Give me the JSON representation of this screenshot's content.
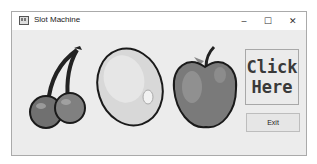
{
  "window": {
    "title": "Slot Machine",
    "app_icon": "slot-machine-icon",
    "controls": {
      "minimize": "–",
      "maximize": "☐",
      "close": "✕"
    }
  },
  "reels": [
    {
      "fruit": "cherries",
      "icon": "cherries-icon"
    },
    {
      "fruit": "lemon",
      "icon": "lemon-icon"
    },
    {
      "fruit": "apple",
      "icon": "apple-icon"
    }
  ],
  "buttons": {
    "click_line1": "Click",
    "click_line2": "Here",
    "exit": "Exit"
  }
}
